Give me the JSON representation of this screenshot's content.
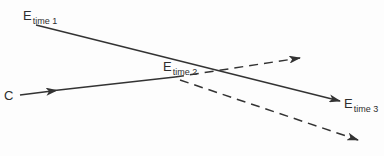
{
  "labels": {
    "e1": {
      "main": "E",
      "sub": "time 1"
    },
    "e2": {
      "main": "E",
      "sub": "time 2"
    },
    "e3": {
      "main": "E",
      "sub": "time 3"
    },
    "c": {
      "main": "C"
    }
  },
  "colors": {
    "stroke": "#333333",
    "background": "#fdfdfd"
  }
}
